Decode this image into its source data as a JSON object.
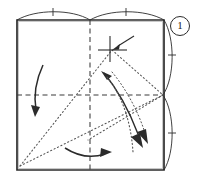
{
  "figure": {
    "kind": "origami-instruction-diagram",
    "step_number": "1",
    "paper": {
      "shape": "square",
      "corners": {
        "top_left": [
          17,
          20
        ],
        "top_right": [
          164,
          20
        ],
        "bottom_right": [
          164,
          170
        ],
        "bottom_left": [
          17,
          170
        ]
      },
      "outline_color": "#2b2b2b"
    },
    "creases": {
      "existing_color": "#3a3a3a",
      "valley_mountain_note": "dashed lines are existing creases (vertical and horizontal centre lines)",
      "new_color": "#555555",
      "new_note": "dotted lines are new fold lines being made this step",
      "existing": [
        {
          "name": "vertical-centre-crease",
          "from": [
            90,
            20
          ],
          "to": [
            90,
            170
          ],
          "style": "dashed"
        },
        {
          "name": "horizontal-centre-crease",
          "from": [
            17,
            95
          ],
          "to": [
            164,
            95
          ],
          "style": "dashed"
        }
      ],
      "new": [
        {
          "name": "fold-line-bottomleft-to-apex",
          "from": [
            20,
            166
          ],
          "to": [
            112,
            50
          ],
          "style": "dotted"
        },
        {
          "name": "fold-line-apex-to-right-mid",
          "from": [
            112,
            50
          ],
          "to": [
            163,
            95
          ],
          "style": "dotted"
        },
        {
          "name": "fold-line-bottomleft-to-right-mid",
          "from": [
            20,
            166
          ],
          "to": [
            163,
            95
          ],
          "style": "dotted"
        },
        {
          "name": "fold-line-right-mid-to-lower-centre",
          "from": [
            163,
            95
          ],
          "to": [
            88,
            140
          ],
          "style": "dotted"
        }
      ]
    },
    "reference_mark": {
      "name": "crosshair-reference-point",
      "position": [
        112,
        50
      ],
      "description": "small cross marking the reference point where the fold lands"
    },
    "pointer_arrow": {
      "name": "reference-pointer-arrow",
      "from": [
        134,
        36
      ],
      "to": [
        114,
        49
      ],
      "description": "straight arrow pointing at the crosshair reference point"
    },
    "edge_arcs": [
      {
        "name": "arc-top-left",
        "side": "top",
        "tick": true
      },
      {
        "name": "arc-top-right",
        "side": "top",
        "tick": true
      },
      {
        "name": "arc-right-upper",
        "side": "right",
        "tick": true
      },
      {
        "name": "arc-right-lower",
        "side": "right",
        "tick": true
      }
    ],
    "motion_arrows": [
      {
        "name": "fold-arrow-left",
        "direction": "down",
        "style": "curved-solid",
        "location": "left panel"
      },
      {
        "name": "fold-arrow-bottom",
        "direction": "right",
        "style": "curved-solid",
        "location": "bottom centre"
      },
      {
        "name": "fold-arrow-centre-solid",
        "direction": "down-right",
        "style": "curved-solid",
        "location": "centre"
      },
      {
        "name": "fold-arrow-centre-dotted",
        "direction": "down",
        "style": "curved-dotted",
        "location": "centre-right"
      }
    ],
    "colors": {
      "ink": "#2b2b2b",
      "crease": "#3a3a3a",
      "fold_line": "#555555",
      "paper": "#ffffff"
    }
  }
}
